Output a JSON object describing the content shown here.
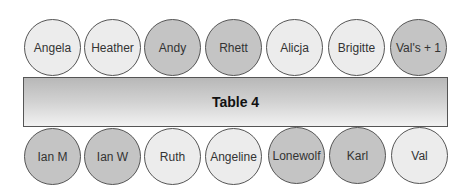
{
  "table": {
    "label": "Table 4"
  },
  "top_row": [
    {
      "name": "Angela",
      "shade": "light"
    },
    {
      "name": "Heather",
      "shade": "light"
    },
    {
      "name": "Andy",
      "shade": "dark"
    },
    {
      "name": "Rhett",
      "shade": "dark"
    },
    {
      "name": "Alicja",
      "shade": "light"
    },
    {
      "name": "Brigitte",
      "shade": "light"
    },
    {
      "name": "Val's + 1",
      "shade": "dark"
    }
  ],
  "bottom_row": [
    {
      "name": "Ian M",
      "shade": "dark"
    },
    {
      "name": "Ian W",
      "shade": "dark"
    },
    {
      "name": "Ruth",
      "shade": "light"
    },
    {
      "name": "Angeline",
      "shade": "light"
    },
    {
      "name": "Lonewolf",
      "shade": "dark"
    },
    {
      "name": "Karl",
      "shade": "dark"
    },
    {
      "name": "Val",
      "shade": "light"
    }
  ],
  "colors": {
    "light_seat": "#ececec",
    "dark_seat": "#c4c4c4",
    "border": "#555555"
  }
}
